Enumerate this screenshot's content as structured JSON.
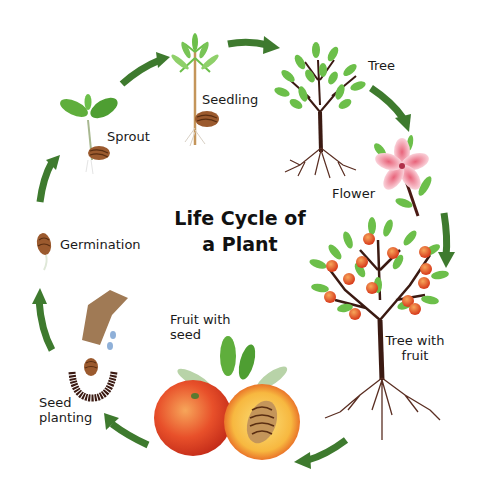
{
  "title": {
    "line1": "Life Cycle of",
    "line2": "a Plant"
  },
  "stages": [
    {
      "id": "seed-planting",
      "label_line1": "Seed",
      "label_line2": "planting"
    },
    {
      "id": "germination",
      "label": "Germination"
    },
    {
      "id": "sprout",
      "label": "Sprout"
    },
    {
      "id": "seedling",
      "label": "Seedling"
    },
    {
      "id": "tree",
      "label": "Tree"
    },
    {
      "id": "flower",
      "label": "Flower"
    },
    {
      "id": "tree-with-fruit",
      "label_line1": "Tree with",
      "label_line2": "fruit"
    },
    {
      "id": "fruit-with-seed",
      "label_line1": "Fruit with",
      "label_line2": "seed"
    }
  ],
  "colors": {
    "arrow": "#3e7a2e",
    "leaf": "#6cbf4a",
    "leaf_dark": "#3f8f2f",
    "trunk": "#3b1a12",
    "seed": "#9b5a2e",
    "flower": "#f3a5b3",
    "fruit": "#e8502a",
    "fruit_inner": "#f7c24a"
  },
  "cycle_order": [
    "Seed planting",
    "Germination",
    "Sprout",
    "Seedling",
    "Tree",
    "Flower",
    "Tree with fruit",
    "Fruit with seed"
  ]
}
